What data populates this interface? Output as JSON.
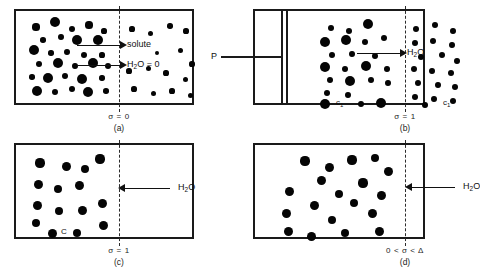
{
  "figure": {
    "background_color": "#ffffff",
    "ink_color": "#111111",
    "membrane_style": "dashed vertical line"
  },
  "panels": [
    {
      "id": "a",
      "caption": "(a)",
      "sigma_label": "σ = 0",
      "membrane_x": 105,
      "arrows": [
        {
          "name": "solute-arrow",
          "label": "solute",
          "direction": "right"
        },
        {
          "name": "water-arrow",
          "label_prefix": "H",
          "label_sub": "2",
          "label_suffix": "O = 0",
          "direction": "right"
        }
      ],
      "left_dots": [
        {
          "x": 22,
          "y": 18,
          "r": 3.6
        },
        {
          "x": 41,
          "y": 13,
          "r": 5.2
        },
        {
          "x": 58,
          "y": 20,
          "r": 3.2
        },
        {
          "x": 75,
          "y": 16,
          "r": 3.6
        },
        {
          "x": 90,
          "y": 22,
          "r": 2.6
        },
        {
          "x": 29,
          "y": 31,
          "r": 2.8
        },
        {
          "x": 47,
          "y": 28,
          "r": 2.9
        },
        {
          "x": 63,
          "y": 31,
          "r": 5.0
        },
        {
          "x": 84,
          "y": 31,
          "r": 5.1
        },
        {
          "x": 20,
          "y": 41,
          "r": 5.3
        },
        {
          "x": 37,
          "y": 44,
          "r": 2.7
        },
        {
          "x": 53,
          "y": 43,
          "r": 2.9
        },
        {
          "x": 70,
          "y": 46,
          "r": 3.1
        },
        {
          "x": 88,
          "y": 46,
          "r": 2.6
        },
        {
          "x": 25,
          "y": 55,
          "r": 3.2
        },
        {
          "x": 44,
          "y": 54,
          "r": 5.2
        },
        {
          "x": 61,
          "y": 57,
          "r": 2.9
        },
        {
          "x": 79,
          "y": 54,
          "r": 5.4
        },
        {
          "x": 94,
          "y": 57,
          "r": 3.0
        },
        {
          "x": 18,
          "y": 68,
          "r": 2.8
        },
        {
          "x": 34,
          "y": 69,
          "r": 5.3
        },
        {
          "x": 51,
          "y": 67,
          "r": 3.0
        },
        {
          "x": 68,
          "y": 70,
          "r": 5.1
        },
        {
          "x": 88,
          "y": 69,
          "r": 2.7
        },
        {
          "x": 23,
          "y": 82,
          "r": 5.2
        },
        {
          "x": 41,
          "y": 83,
          "r": 3.0
        },
        {
          "x": 58,
          "y": 80,
          "r": 3.2
        },
        {
          "x": 74,
          "y": 83,
          "r": 5.0
        },
        {
          "x": 92,
          "y": 82,
          "r": 2.8
        }
      ],
      "right_dots": [
        {
          "x": 118,
          "y": 20,
          "r": 2.6
        },
        {
          "x": 136,
          "y": 24,
          "r": 2.5
        },
        {
          "x": 156,
          "y": 17,
          "r": 2.7
        },
        {
          "x": 172,
          "y": 22,
          "r": 2.6
        },
        {
          "x": 166,
          "y": 41,
          "r": 2.5
        },
        {
          "x": 178,
          "y": 55,
          "r": 2.6
        },
        {
          "x": 115,
          "y": 62,
          "r": 2.6
        },
        {
          "x": 134,
          "y": 59,
          "r": 2.5
        },
        {
          "x": 152,
          "y": 64,
          "r": 2.6
        },
        {
          "x": 171,
          "y": 70,
          "r": 2.5
        },
        {
          "x": 120,
          "y": 80,
          "r": 2.6
        },
        {
          "x": 139,
          "y": 84,
          "r": 2.5
        },
        {
          "x": 158,
          "y": 82,
          "r": 2.6
        },
        {
          "x": 176,
          "y": 86,
          "r": 2.5
        },
        {
          "x": 143,
          "y": 44,
          "r": 2.4
        }
      ]
    },
    {
      "id": "b",
      "caption": "(b)",
      "sigma_label": "σ = 1",
      "pressure_label": "P",
      "left_conc_label": "c",
      "left_conc_sub": "1",
      "right_conc_label": "c",
      "right_conc_sub": "1",
      "membrane_x": 152,
      "arrows": [
        {
          "name": "water-arrow",
          "label_prefix": "H",
          "label_sub": "2",
          "label_suffix": "O",
          "direction": "right"
        }
      ],
      "left_dots": [
        {
          "x": 78,
          "y": 19,
          "r": 3.1
        },
        {
          "x": 96,
          "y": 22,
          "r": 3.2
        },
        {
          "x": 115,
          "y": 15,
          "r": 5.3
        },
        {
          "x": 72,
          "y": 33,
          "r": 5.2
        },
        {
          "x": 93,
          "y": 31,
          "r": 4.9
        },
        {
          "x": 112,
          "y": 33,
          "r": 3.0
        },
        {
          "x": 131,
          "y": 29,
          "r": 3.1
        },
        {
          "x": 79,
          "y": 46,
          "r": 3.1
        },
        {
          "x": 99,
          "y": 45,
          "r": 2.9
        },
        {
          "x": 122,
          "y": 47,
          "r": 3.0
        },
        {
          "x": 72,
          "y": 58,
          "r": 5.3
        },
        {
          "x": 92,
          "y": 60,
          "r": 3.0
        },
        {
          "x": 113,
          "y": 57,
          "r": 5.1
        },
        {
          "x": 134,
          "y": 60,
          "r": 2.9
        },
        {
          "x": 77,
          "y": 71,
          "r": 3.0
        },
        {
          "x": 97,
          "y": 72,
          "r": 5.0
        },
        {
          "x": 118,
          "y": 71,
          "r": 3.1
        },
        {
          "x": 135,
          "y": 74,
          "r": 2.9
        },
        {
          "x": 74,
          "y": 84,
          "r": 3.1
        },
        {
          "x": 95,
          "y": 86,
          "r": 2.9
        },
        {
          "x": 72,
          "y": 95,
          "r": 5.2
        },
        {
          "x": 108,
          "y": 95,
          "r": 3.0
        },
        {
          "x": 128,
          "y": 94,
          "r": 5.1
        }
      ],
      "right_dots": [
        {
          "x": 163,
          "y": 20,
          "r": 3.0
        },
        {
          "x": 182,
          "y": 16,
          "r": 3.1
        },
        {
          "x": 200,
          "y": 22,
          "r": 2.9
        },
        {
          "x": 162,
          "y": 34,
          "r": 3.0
        },
        {
          "x": 180,
          "y": 32,
          "r": 3.0
        },
        {
          "x": 199,
          "y": 36,
          "r": 2.9
        },
        {
          "x": 168,
          "y": 48,
          "r": 3.0
        },
        {
          "x": 189,
          "y": 46,
          "r": 3.1
        },
        {
          "x": 204,
          "y": 52,
          "r": 2.9
        },
        {
          "x": 161,
          "y": 60,
          "r": 3.0
        },
        {
          "x": 179,
          "y": 62,
          "r": 2.9
        },
        {
          "x": 198,
          "y": 64,
          "r": 3.0
        },
        {
          "x": 165,
          "y": 74,
          "r": 3.0
        },
        {
          "x": 185,
          "y": 76,
          "r": 2.9
        },
        {
          "x": 202,
          "y": 78,
          "r": 3.0
        },
        {
          "x": 162,
          "y": 88,
          "r": 3.0
        },
        {
          "x": 181,
          "y": 90,
          "r": 2.9
        },
        {
          "x": 200,
          "y": 92,
          "r": 3.0
        },
        {
          "x": 172,
          "y": 96,
          "r": 2.9
        }
      ]
    },
    {
      "id": "c",
      "caption": "(c)",
      "sigma_label": "σ = 1",
      "conc_label": "C",
      "membrane_x": 105,
      "arrows": [
        {
          "name": "water-arrow",
          "label_prefix": "H",
          "label_sub": "2",
          "label_suffix": "O",
          "direction": "left"
        }
      ],
      "left_dots": [
        {
          "x": 26,
          "y": 20,
          "r": 4.6
        },
        {
          "x": 52,
          "y": 23,
          "r": 4.5
        },
        {
          "x": 71,
          "y": 26,
          "r": 4.4
        },
        {
          "x": 86,
          "y": 16,
          "r": 4.6
        },
        {
          "x": 24,
          "y": 41,
          "r": 4.5
        },
        {
          "x": 44,
          "y": 46,
          "r": 4.4
        },
        {
          "x": 65,
          "y": 42,
          "r": 4.5
        },
        {
          "x": 23,
          "y": 62,
          "r": 4.5
        },
        {
          "x": 45,
          "y": 68,
          "r": 4.4
        },
        {
          "x": 68,
          "y": 67,
          "r": 4.5
        },
        {
          "x": 88,
          "y": 60,
          "r": 4.5
        },
        {
          "x": 22,
          "y": 80,
          "r": 4.4
        },
        {
          "x": 38,
          "y": 90,
          "r": 4.5
        },
        {
          "x": 63,
          "y": 90,
          "r": 4.4
        },
        {
          "x": 89,
          "y": 82,
          "r": 4.5
        }
      ],
      "right_dots": []
    },
    {
      "id": "d",
      "caption": "(d)",
      "sigma_label": "0 < σ < Δ",
      "membrane_x": 152,
      "arrows": [
        {
          "name": "water-arrow",
          "label_prefix": "H",
          "label_sub": "2",
          "label_suffix": "O",
          "direction": "left"
        }
      ],
      "left_dots": [
        {
          "x": 52,
          "y": 18,
          "r": 4.6
        },
        {
          "x": 76,
          "y": 24,
          "r": 4.5
        },
        {
          "x": 99,
          "y": 17,
          "r": 4.6
        },
        {
          "x": 122,
          "y": 15,
          "r": 4.4
        },
        {
          "x": 135,
          "y": 28,
          "r": 4.5
        },
        {
          "x": 68,
          "y": 37,
          "r": 4.5
        },
        {
          "x": 110,
          "y": 40,
          "r": 4.6
        },
        {
          "x": 36,
          "y": 48,
          "r": 4.5
        },
        {
          "x": 86,
          "y": 51,
          "r": 4.4
        },
        {
          "x": 128,
          "y": 52,
          "r": 4.5
        },
        {
          "x": 61,
          "y": 62,
          "r": 4.5
        },
        {
          "x": 101,
          "y": 60,
          "r": 4.4
        },
        {
          "x": 33,
          "y": 70,
          "r": 4.5
        },
        {
          "x": 119,
          "y": 70,
          "r": 4.5
        },
        {
          "x": 79,
          "y": 77,
          "r": 4.4
        },
        {
          "x": 35,
          "y": 88,
          "r": 4.5
        },
        {
          "x": 58,
          "y": 93,
          "r": 4.5
        },
        {
          "x": 92,
          "y": 90,
          "r": 4.4
        },
        {
          "x": 126,
          "y": 88,
          "r": 4.5
        }
      ],
      "right_dots": []
    }
  ]
}
